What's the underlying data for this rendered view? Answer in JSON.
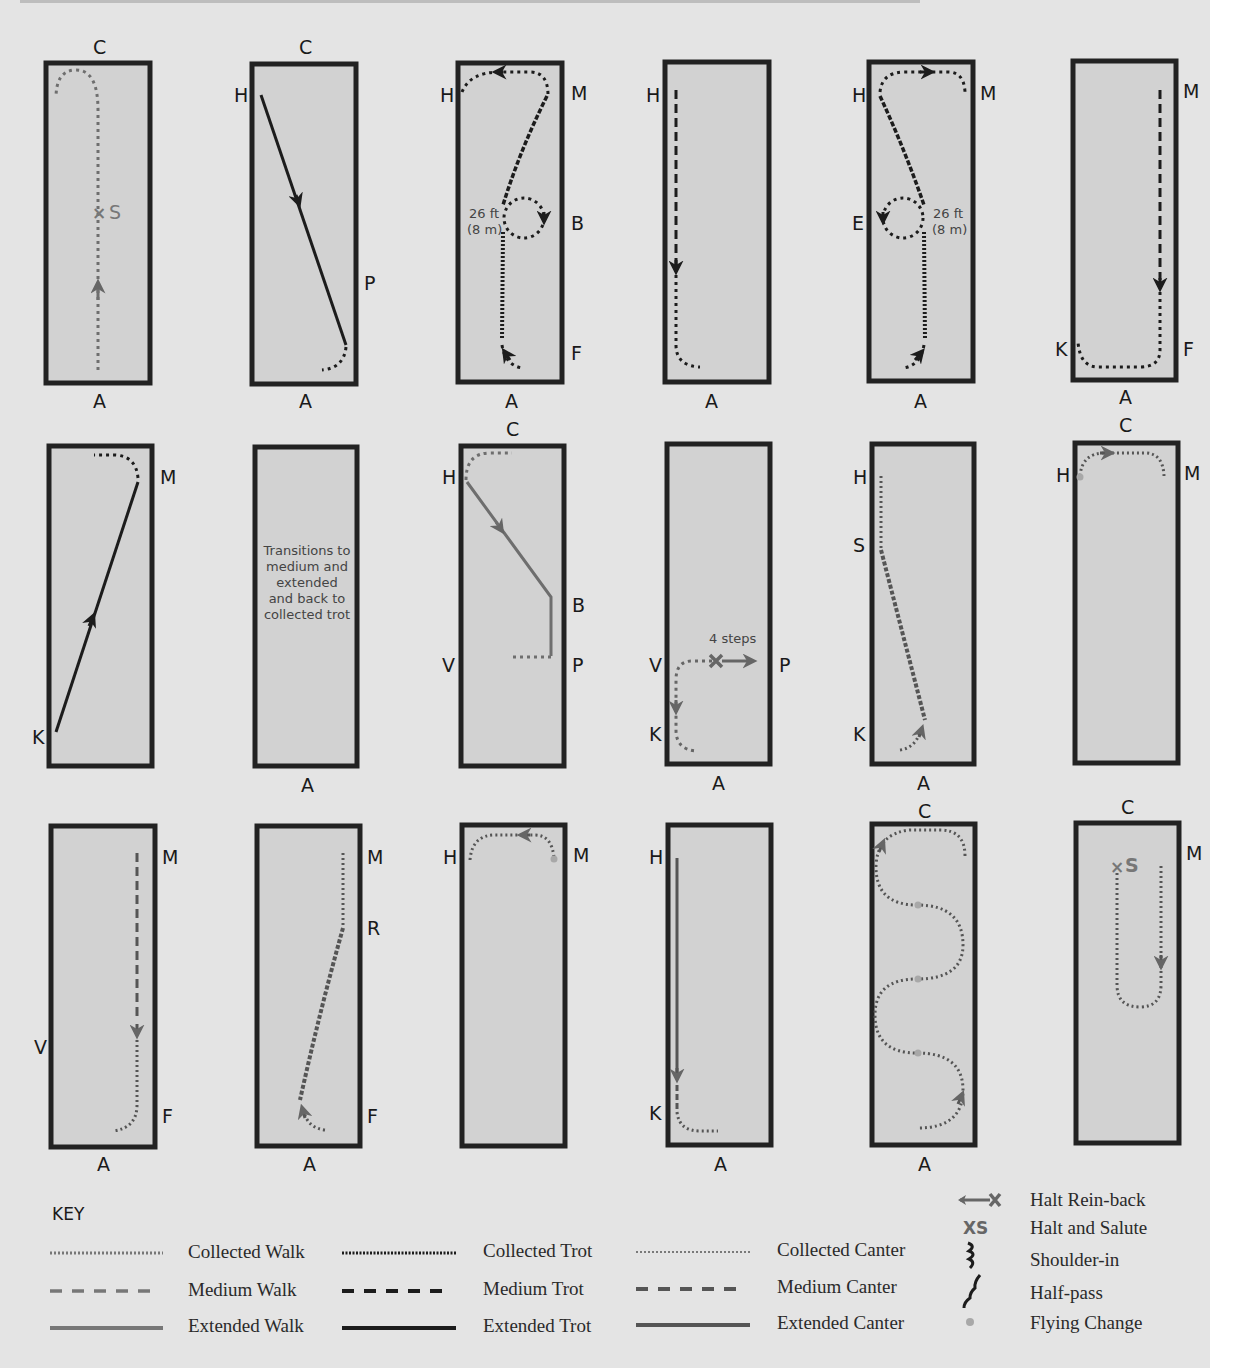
{
  "diagram": {
    "arena_markers": [
      "A",
      "C",
      "H",
      "M",
      "B",
      "E",
      "F",
      "K",
      "P",
      "V",
      "R",
      "S"
    ],
    "arenas": [
      {
        "id": 1,
        "row": 1,
        "col": 1,
        "labels": {
          "top": "C",
          "bottom": "A"
        },
        "salute": "S",
        "path": "collected walk up centerline to halt and salute, then turn left"
      },
      {
        "id": 2,
        "row": 1,
        "col": 2,
        "labels": {
          "top": "C",
          "bottom": "A",
          "left": [
            "H"
          ],
          "right": [
            "P"
          ]
        },
        "path": "extended trot H to P diagonal"
      },
      {
        "id": 3,
        "row": 1,
        "col": 3,
        "labels": {
          "bottom": "A",
          "left": [
            "H"
          ],
          "right": [
            "M",
            "B",
            "F"
          ]
        },
        "circle_note": [
          "26 ft",
          "(8 m)"
        ],
        "path": "shoulder-in, 8 m circle at B, half-pass to M"
      },
      {
        "id": 4,
        "row": 1,
        "col": 4,
        "labels": {
          "bottom": "A",
          "left": [
            "H"
          ]
        },
        "path": "medium trot down from H"
      },
      {
        "id": 5,
        "row": 1,
        "col": 5,
        "labels": {
          "bottom": "A",
          "left": [
            "H",
            "E"
          ],
          "right": [
            "M"
          ]
        },
        "circle_note": [
          "26 ft",
          "(8 m)"
        ],
        "path": "shoulder-in, 8 m circle at E, half-pass to H"
      },
      {
        "id": 6,
        "row": 1,
        "col": 6,
        "labels": {
          "bottom": "A",
          "left": [
            "K"
          ],
          "right": [
            "M",
            "F"
          ]
        },
        "path": "medium trot M to F"
      },
      {
        "id": 7,
        "row": 2,
        "col": 1,
        "labels": {
          "left": [
            "K"
          ],
          "right": [
            "M"
          ]
        },
        "path": "extended trot K to M"
      },
      {
        "id": 8,
        "row": 2,
        "col": 2,
        "labels": {
          "bottom": "A"
        },
        "text": [
          "Transitions to",
          "medium and",
          "extended",
          "and back to",
          "collected trot"
        ]
      },
      {
        "id": 9,
        "row": 2,
        "col": 3,
        "labels": {
          "top": "C",
          "left": [
            "H",
            "V"
          ],
          "right": [
            "B",
            "P"
          ]
        },
        "path": "extended walk H to B"
      },
      {
        "id": 10,
        "row": 2,
        "col": 4,
        "labels": {
          "bottom": "A",
          "left": [
            "V",
            "K"
          ],
          "right": [
            "P"
          ]
        },
        "rein_back_note": "4 steps",
        "path": "halt rein-back 4 steps"
      },
      {
        "id": 11,
        "row": 2,
        "col": 5,
        "labels": {
          "bottom": "A",
          "left": [
            "H",
            "S",
            "K"
          ]
        },
        "path": "half-pass canter S to K"
      },
      {
        "id": 12,
        "row": 2,
        "col": 6,
        "labels": {
          "top": "C",
          "left": [
            "H"
          ],
          "right": [
            "M"
          ]
        },
        "path": "flying change at H"
      },
      {
        "id": 13,
        "row": 3,
        "col": 1,
        "labels": {
          "bottom": "A",
          "left": [
            "V"
          ],
          "right": [
            "M",
            "F"
          ]
        },
        "path": "medium canter M to F"
      },
      {
        "id": 14,
        "row": 3,
        "col": 2,
        "labels": {
          "bottom": "A",
          "right": [
            "M",
            "R",
            "F"
          ]
        },
        "path": "half-pass canter F to R"
      },
      {
        "id": 15,
        "row": 3,
        "col": 3,
        "labels": {
          "left": [
            "H"
          ],
          "right": [
            "M"
          ]
        },
        "path": "flying change at M"
      },
      {
        "id": 16,
        "row": 3,
        "col": 4,
        "labels": {
          "bottom": "A",
          "left": [
            "H",
            "K"
          ]
        },
        "path": "extended canter H to K"
      },
      {
        "id": 17,
        "row": 3,
        "col": 5,
        "labels": {
          "top": "C",
          "bottom": "A"
        },
        "path": "serpentine with flying changes"
      },
      {
        "id": 18,
        "row": 3,
        "col": 6,
        "labels": {
          "top": "C",
          "right": [
            "M"
          ]
        },
        "salute": "S",
        "path": "turn down centerline to halt and salute"
      }
    ]
  },
  "key": {
    "heading": "KEY",
    "gaits": [
      {
        "label": "Collected Walk",
        "style": "dotted-gray"
      },
      {
        "label": "Medium Walk",
        "style": "dashed-gray"
      },
      {
        "label": "Extended Walk",
        "style": "solid-gray"
      },
      {
        "label": "Collected Trot",
        "style": "dotted-black"
      },
      {
        "label": "Medium Trot",
        "style": "dashed-black"
      },
      {
        "label": "Extended Trot",
        "style": "solid-black"
      },
      {
        "label": "Collected Canter",
        "style": "fine-dotted-gray"
      },
      {
        "label": "Medium Canter",
        "style": "dashed-dark-gray"
      },
      {
        "label": "Extended Canter",
        "style": "solid-dark-gray"
      }
    ],
    "symbols": [
      {
        "icon": "halt-rein-back-icon",
        "label": "Halt Rein-back"
      },
      {
        "icon": "halt-salute-icon",
        "glyph": "XS",
        "label": "Halt and Salute"
      },
      {
        "icon": "shoulder-in-icon",
        "label": "Shoulder-in"
      },
      {
        "icon": "half-pass-icon",
        "label": "Half-pass"
      },
      {
        "icon": "flying-change-icon",
        "label": "Flying Change"
      }
    ]
  },
  "colors": {
    "page": "#e4e4e4",
    "arena_fill": "#d2d2d2",
    "arena_border": "#222222",
    "walk": "#6e6e6e",
    "trot": "#1c1c1c",
    "canter": "#555555",
    "flying_change": "#a8a8a8"
  }
}
